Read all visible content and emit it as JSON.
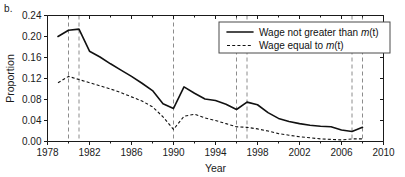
{
  "figure": {
    "panel_label": "b."
  },
  "chart_data": {
    "type": "line",
    "title": "",
    "xlabel": "Year",
    "ylabel": "Proportion",
    "xlim": [
      1978,
      2010
    ],
    "ylim": [
      0.0,
      0.24
    ],
    "grid": false,
    "legend_position": "top-right",
    "xticks": [
      1978,
      1982,
      1986,
      1990,
      1994,
      1998,
      2002,
      2006,
      2010
    ],
    "xtick_labels": [
      "1978",
      "1982",
      "1986",
      "1990",
      "1994",
      "1998",
      "2002",
      "2006",
      "2010"
    ],
    "xtick_minor": [
      1980,
      1984,
      1988,
      1992,
      1996,
      2000,
      2004,
      2008
    ],
    "yticks": [
      0.0,
      0.04,
      0.08,
      0.12,
      0.16,
      0.2,
      0.24
    ],
    "ytick_labels": [
      "0.00",
      "0.04",
      "0.08",
      "0.12",
      "0.16",
      "0.20",
      "0.24"
    ],
    "x": [
      1979,
      1980,
      1981,
      1982,
      1983,
      1984,
      1985,
      1986,
      1987,
      1988,
      1989,
      1990,
      1991,
      1992,
      1993,
      1994,
      1995,
      1996,
      1997,
      1998,
      1999,
      2000,
      2001,
      2002,
      2003,
      2004,
      2005,
      2006,
      2007,
      2008
    ],
    "series": [
      {
        "name": "Wage not greater than m(t)",
        "style": "solid",
        "legend_label_plain": "Wage not greater than ",
        "legend_label_italic": "m",
        "legend_label_tail": "(t)",
        "values": [
          0.2,
          0.212,
          0.214,
          0.172,
          0.161,
          0.148,
          0.136,
          0.124,
          0.111,
          0.097,
          0.072,
          0.063,
          0.104,
          0.092,
          0.081,
          0.078,
          0.071,
          0.061,
          0.075,
          0.07,
          0.055,
          0.044,
          0.038,
          0.034,
          0.031,
          0.029,
          0.028,
          0.022,
          0.019,
          0.027
        ]
      },
      {
        "name": "Wage equal to m(t)",
        "style": "dashed",
        "legend_label_plain": "Wage equal to ",
        "legend_label_italic": "m",
        "legend_label_tail": "(t)",
        "values": [
          0.112,
          0.124,
          0.118,
          0.112,
          0.106,
          0.1,
          0.093,
          0.085,
          0.077,
          0.066,
          0.047,
          0.023,
          0.048,
          0.052,
          0.045,
          0.04,
          0.034,
          0.028,
          0.027,
          0.024,
          0.02,
          0.015,
          0.012,
          0.009,
          0.007,
          0.005,
          0.004,
          0.003,
          0.005,
          0.005
        ]
      }
    ],
    "event_lines": [
      1980,
      1981,
      1990,
      1996,
      1997,
      2007,
      2008
    ]
  }
}
